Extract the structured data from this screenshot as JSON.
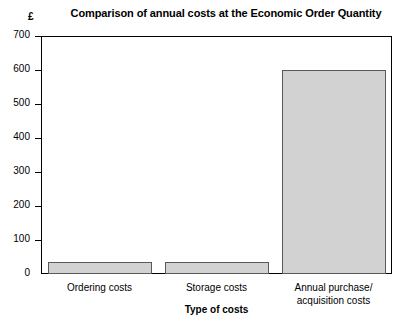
{
  "chart_data": {
    "type": "bar",
    "title": "Comparison of annual costs at the Economic Order Quantity",
    "xlabel": "Type of costs",
    "ylabel": "£",
    "categories": [
      "Ordering costs",
      "Storage costs",
      "Annual purchase/\nacquisition costs"
    ],
    "values": [
      35,
      35,
      600
    ],
    "ylim": [
      0,
      700
    ],
    "yticks": [
      0,
      100,
      200,
      300,
      400,
      500,
      600,
      700
    ],
    "ytick_labels": [
      "0",
      "100",
      "200",
      "300",
      "400",
      "500",
      "600",
      "700"
    ],
    "grid": false,
    "legend": null,
    "bar_fill_color": "#d2d2d2",
    "bar_edge_color": "#595959",
    "axis_color": "#000000",
    "background_color": "#ffffff"
  }
}
